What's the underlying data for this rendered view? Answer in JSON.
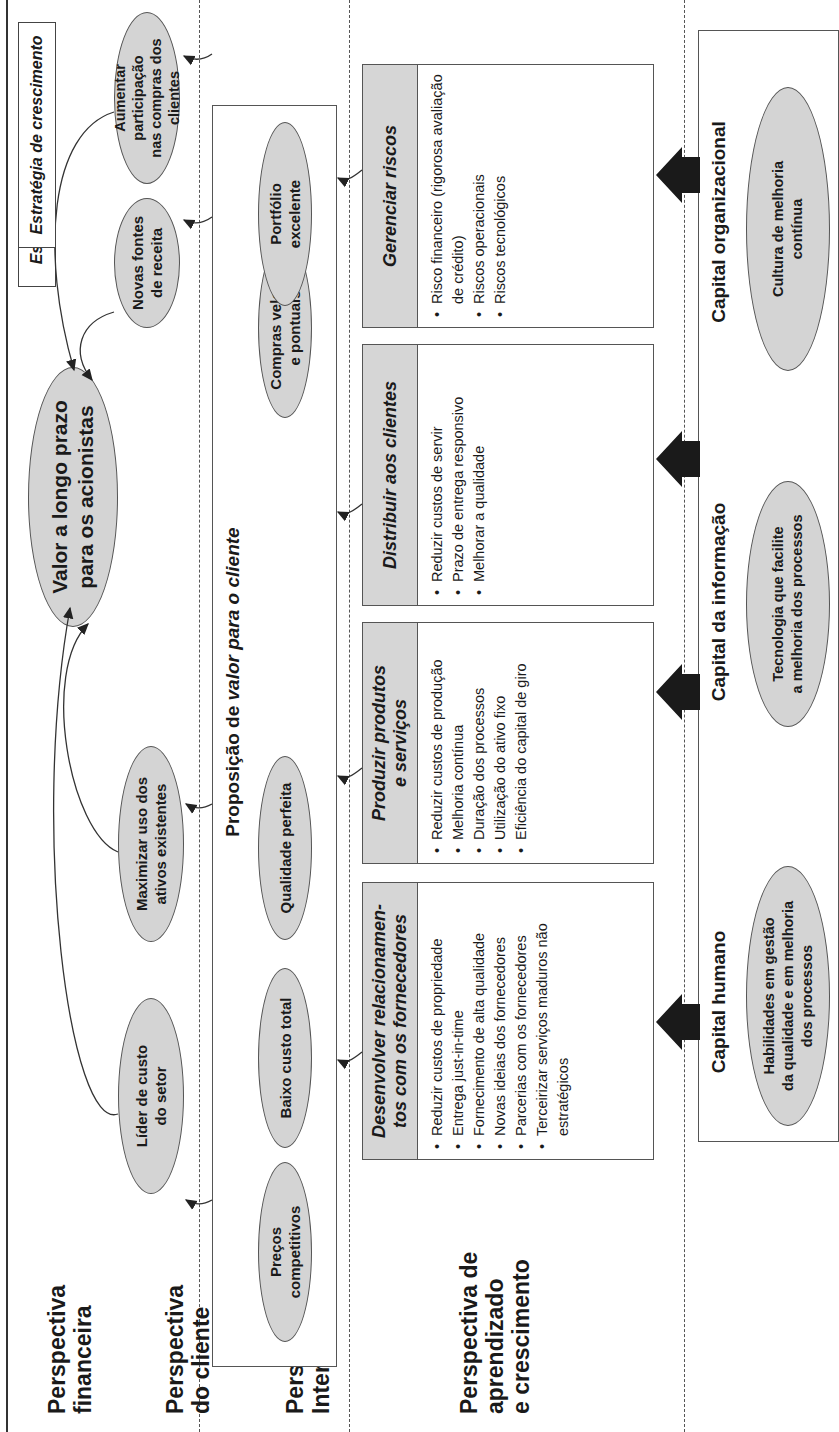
{
  "orientation": "rotated-90-ccw",
  "perspectives": [
    {
      "id": "financial",
      "label_line1": "Perspectiva",
      "label_line2": "financeira"
    },
    {
      "id": "customer",
      "label_line1": "Perspectiva",
      "label_line2": "do cliente"
    },
    {
      "id": "internal",
      "label_line1": "Perspectiva",
      "label_line2": "Interna"
    },
    {
      "id": "learning",
      "label_line1": "Perspectiva de",
      "label_line2": "aprendizado",
      "label_line3": "e crescimento"
    }
  ],
  "financial": {
    "main_goal": {
      "line1": "Valor a longo prazo",
      "line2": "para os acionistas"
    },
    "productivity_strategy": "Estratégia de produtividade",
    "growth_strategy": "Estratégia de crescimento",
    "objectives": [
      {
        "line1": "Líder de custo",
        "line2": "do setor"
      },
      {
        "line1": "Maximizar uso dos",
        "line2": "ativos existentes"
      },
      {
        "line1": "Novas fontes",
        "line2": "de receita"
      },
      {
        "line1": "Aumentar participação",
        "line2": "nas compras dos clientes"
      }
    ]
  },
  "customer": {
    "title_normal": "Proposição de ",
    "title_italic": "valor para o cliente",
    "values": [
      {
        "line1": "Preços",
        "line2": "competitivos"
      },
      {
        "line1": "Baixo custo total",
        "line2": ""
      },
      {
        "line1": "Qualidade perfeita",
        "line2": ""
      },
      {
        "line1": "Compras velozes",
        "line2": "e pontuais"
      },
      {
        "line1": "Portfólio",
        "line2": "excelente"
      }
    ]
  },
  "internal": {
    "processes": [
      {
        "title_line1": "Desenvolver relacionamen-",
        "title_line2": "tos com os fornecedores",
        "items": [
          "Reduzir custos de propriedade",
          "Entrega just-in-time",
          "Fornecimento de alta qualidade",
          "Novas ideias dos fornecedores",
          "Parcerias com os fornecedores",
          "Terceirizar serviços maduros não estratégicos"
        ]
      },
      {
        "title_line1": "Produzir produtos",
        "title_line2": "e serviços",
        "items": [
          "Reduzir custos de produção",
          "Melhoria contínua",
          "Duração dos processos",
          "Utilização do ativo fixo",
          "Eficiência do capital de giro"
        ]
      },
      {
        "title_line1": "Distribuir aos clientes",
        "title_line2": "",
        "items": [
          "Reduzir custos de servir",
          "Prazo de entrega responsivo",
          "Melhorar a qualidade"
        ]
      },
      {
        "title_line1": "Gerenciar riscos",
        "title_line2": "",
        "items": [
          "Risco financeiro (rigorosa avaliação de crédito)",
          "Riscos operacionais",
          "Riscos tecnológicos"
        ]
      }
    ]
  },
  "learning": {
    "capitals": [
      {
        "title": "Capital humano",
        "line1": "Habilidades em  gestão",
        "line2": "da qualidade e em melhoria",
        "line3": "dos processos"
      },
      {
        "title": "Capital da informação",
        "line1": "Tecnologia que facilite",
        "line2": "a melhoria dos processos",
        "line3": ""
      },
      {
        "title": "Capital organizacional",
        "line1": "Cultura de melhoria",
        "line2": "contínua",
        "line3": ""
      }
    ]
  },
  "colors": {
    "ellipse_fill": "#d4d4d4",
    "header_fill": "#d6d6d6",
    "stroke": "#555555",
    "arrow_fill": "#1a1a1a",
    "background": "#ffffff"
  }
}
